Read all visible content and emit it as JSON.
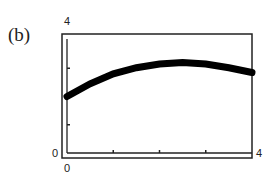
{
  "panel_label": "(b)",
  "chart_data": {
    "type": "line",
    "title": "",
    "xlabel": "",
    "ylabel": "",
    "xlim": [
      0,
      4
    ],
    "ylim": [
      0,
      4
    ],
    "x_tick_labels": [
      "0",
      "4"
    ],
    "y_tick_labels": [
      "0",
      "4"
    ],
    "x_minor_ticks": [
      1,
      2,
      3
    ],
    "y_minor_ticks": [
      1,
      3
    ],
    "grid": false,
    "series": [
      {
        "name": "curve",
        "x": [
          0,
          0.5,
          1,
          1.5,
          2,
          2.5,
          3,
          3.5,
          4
        ],
        "values": [
          2.0,
          2.45,
          2.8,
          3.02,
          3.15,
          3.2,
          3.15,
          3.02,
          2.85
        ]
      }
    ]
  },
  "colors": {
    "curve": "#000000",
    "frame": "#222222"
  }
}
